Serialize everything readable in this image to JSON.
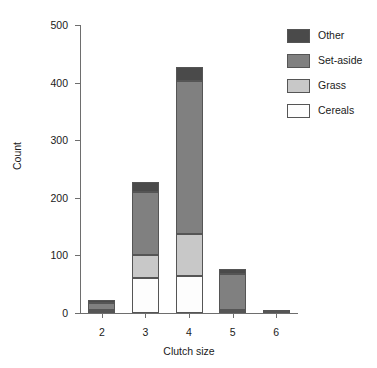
{
  "chart_data": {
    "type": "bar",
    "stacked": true,
    "title": "",
    "xlabel": "Clutch size",
    "ylabel": "Count",
    "categories": [
      "2",
      "3",
      "4",
      "5",
      "6"
    ],
    "ylim": [
      0,
      500
    ],
    "yticks": [
      0,
      100,
      200,
      300,
      400,
      500
    ],
    "ytick_labels": [
      "0",
      "100",
      "200",
      "300",
      "400",
      "500"
    ],
    "grid": false,
    "legend_position": "top-right",
    "stack_order_bottom_to_top": [
      "Cereals",
      "Grass",
      "Set-aside",
      "Other"
    ],
    "series": [
      {
        "name": "Cereals",
        "color": "#fdfdfd",
        "values": [
          2,
          60,
          65,
          3,
          0
        ]
      },
      {
        "name": "Grass",
        "color": "#c8c8c8",
        "values": [
          3,
          40,
          73,
          2,
          0
        ]
      },
      {
        "name": "Set-aside",
        "color": "#808080",
        "values": [
          12,
          110,
          264,
          62,
          2
        ]
      },
      {
        "name": "Other",
        "color": "#4a4a4a",
        "values": [
          5,
          18,
          25,
          10,
          1
        ]
      }
    ],
    "totals": [
      22,
      228,
      427,
      77,
      3
    ]
  },
  "legend": {
    "entries": [
      {
        "label": "Other",
        "color": "#4a4a4a"
      },
      {
        "label": "Set-aside",
        "color": "#808080"
      },
      {
        "label": "Grass",
        "color": "#c8c8c8"
      },
      {
        "label": "Cereals",
        "color": "#fdfdfd"
      }
    ]
  }
}
